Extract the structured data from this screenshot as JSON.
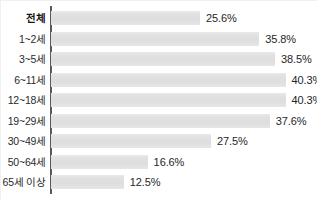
{
  "chart_data": {
    "type": "bar",
    "orientation": "horizontal",
    "title": "",
    "subtitle": "",
    "xlabel": "",
    "ylabel": "",
    "xlim": [
      0,
      45
    ],
    "grid": false,
    "legend": null,
    "unit": "%",
    "bar_color": "#e3e3e3",
    "axis_color": "#5a5a5a",
    "text_color": "#262626",
    "categories": [
      "전체",
      "1~2세",
      "3~5세",
      "6~11세",
      "12~18세",
      "19~29세",
      "30~49세",
      "50~64세",
      "65세 이상"
    ],
    "values": [
      25.6,
      35.8,
      38.5,
      40.3,
      40.3,
      37.6,
      27.5,
      16.6,
      12.5
    ],
    "value_labels": [
      "25.6%",
      "35.8%",
      "38.5%",
      "40.3%",
      "40.3%",
      "37.6%",
      "27.5%",
      "16.6%",
      "12.5%"
    ],
    "emphasized_index": 0
  }
}
